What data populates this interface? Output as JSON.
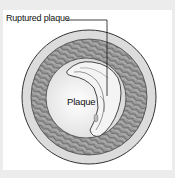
{
  "diagram": {
    "labels": {
      "ruptured_plaque": "Ruptured plaque",
      "plaque": "Plaque"
    },
    "colors": {
      "background": "#ececec",
      "panel": "#ffffff",
      "outer_wall": "#d6d6d6",
      "muscle_layer": "#8a8a8a",
      "lumen": "#f2f2f2",
      "outline": "#333333"
    }
  }
}
